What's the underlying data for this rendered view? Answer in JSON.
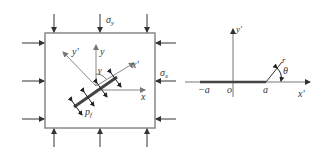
{
  "left_panel": {
    "title": "Plate with inclined crack under biaxial stress",
    "labels": {
      "sigma_y": "σ",
      "sigma_y_sub": "y",
      "sigma_x": "σ",
      "sigma_x_sub": "x",
      "y_axis": "y",
      "x_axis": "x",
      "y_prime": "y'",
      "x_prime": "x'",
      "gamma": "γ",
      "pressure": "p",
      "pressure_sub": "f"
    }
  },
  "right_panel": {
    "title": "Crack-tip polar coordinates",
    "labels": {
      "y_prime": "y'",
      "x_prime": "x'",
      "minus_a": "−a",
      "origin": "o",
      "a": "a",
      "r": "r",
      "theta": "θ"
    }
  },
  "colors": {
    "line": "#555555",
    "crack": "#444444",
    "axis": "#777777",
    "text": "#333333"
  }
}
